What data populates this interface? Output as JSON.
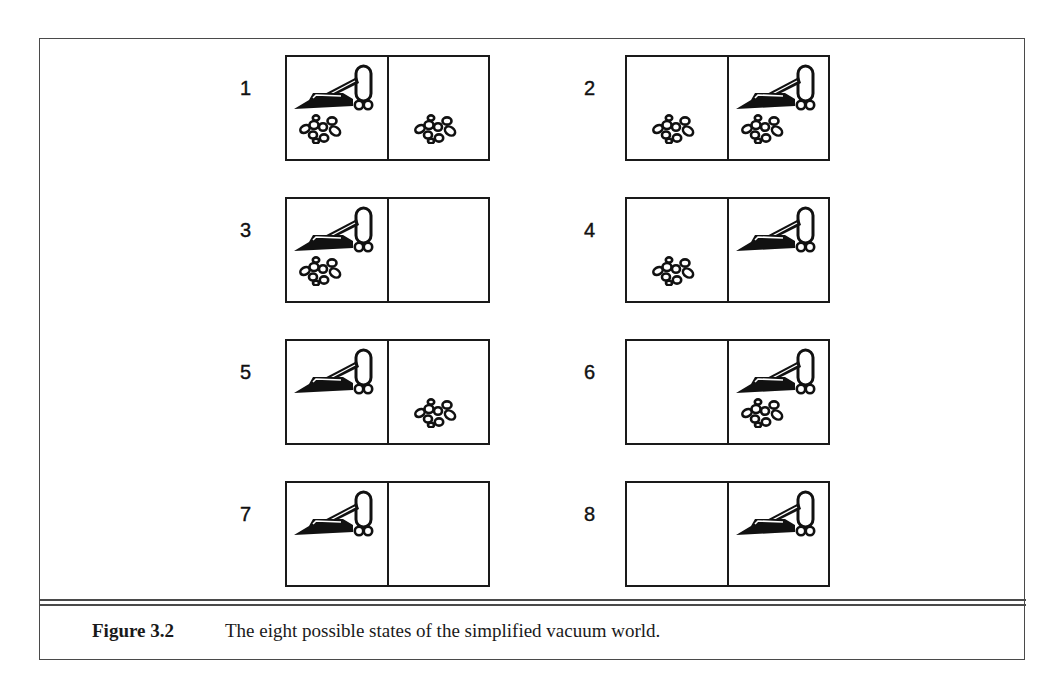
{
  "figure": {
    "label": "Figure 3.2",
    "caption": "The eight possible states of the simplified vacuum world."
  },
  "states": [
    {
      "number": "1",
      "vacuum": "left",
      "dirt_left": true,
      "dirt_right": true
    },
    {
      "number": "2",
      "vacuum": "right",
      "dirt_left": true,
      "dirt_right": true
    },
    {
      "number": "3",
      "vacuum": "left",
      "dirt_left": true,
      "dirt_right": false
    },
    {
      "number": "4",
      "vacuum": "right",
      "dirt_left": true,
      "dirt_right": false
    },
    {
      "number": "5",
      "vacuum": "left",
      "dirt_left": false,
      "dirt_right": true
    },
    {
      "number": "6",
      "vacuum": "right",
      "dirt_left": false,
      "dirt_right": true
    },
    {
      "number": "7",
      "vacuum": "left",
      "dirt_left": false,
      "dirt_right": false
    },
    {
      "number": "8",
      "vacuum": "right",
      "dirt_left": false,
      "dirt_right": false
    }
  ],
  "icons": {
    "vacuum": "vacuum-cleaner-icon",
    "dirt": "dirt-icon"
  },
  "colors": {
    "ink": "#1a1a1a",
    "frame": "#4a4a4a",
    "background": "#ffffff"
  }
}
